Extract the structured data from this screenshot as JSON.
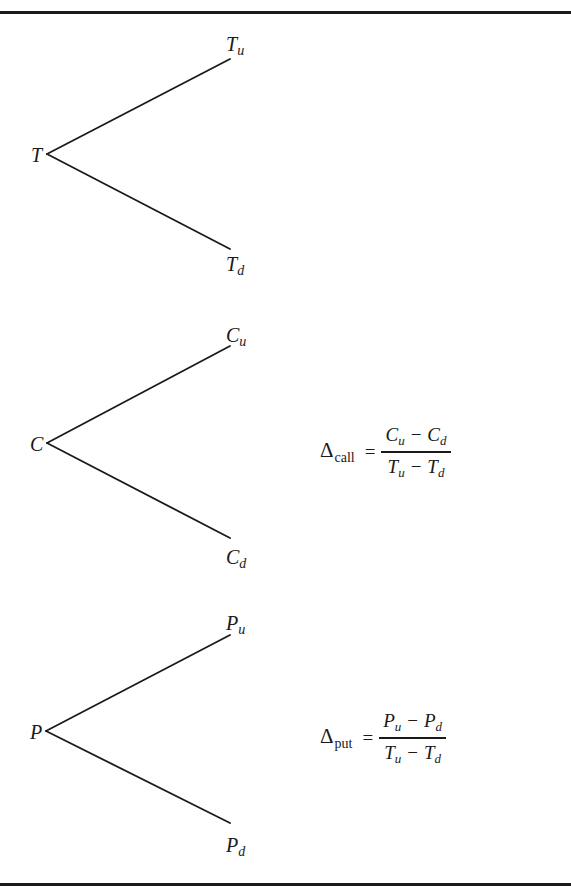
{
  "trees": [
    {
      "id": "underlying",
      "root": {
        "base": "T",
        "sub": ""
      },
      "up": {
        "base": "T",
        "sub": "u"
      },
      "down": {
        "base": "T",
        "sub": "d"
      }
    },
    {
      "id": "call",
      "root": {
        "base": "C",
        "sub": ""
      },
      "up": {
        "base": "C",
        "sub": "u"
      },
      "down": {
        "base": "C",
        "sub": "d"
      }
    },
    {
      "id": "put",
      "root": {
        "base": "P",
        "sub": ""
      },
      "up": {
        "base": "P",
        "sub": "u"
      },
      "down": {
        "base": "P",
        "sub": "d"
      }
    }
  ],
  "formulas": {
    "call": {
      "symbol": "Δ",
      "symbol_sub": "call",
      "equals": "=",
      "numerator": {
        "a": "C",
        "a_sub": "u",
        "op": "−",
        "b": "C",
        "b_sub": "d"
      },
      "denominator": {
        "a": "T",
        "a_sub": "u",
        "op": "−",
        "b": "T",
        "b_sub": "d"
      }
    },
    "put": {
      "symbol": "Δ",
      "symbol_sub": "put",
      "equals": "=",
      "numerator": {
        "a": "P",
        "a_sub": "u",
        "op": "−",
        "b": "P",
        "b_sub": "d"
      },
      "denominator": {
        "a": "T",
        "a_sub": "u",
        "op": "−",
        "b": "T",
        "b_sub": "d"
      }
    }
  }
}
